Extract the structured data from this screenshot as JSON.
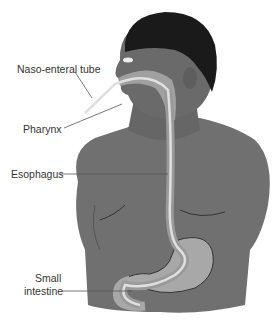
{
  "diagram": {
    "labels": {
      "tube": "Naso-enteral tube",
      "pharynx": "Pharynx",
      "esophagus": "Esophagus",
      "small_intestine_line1": "Small",
      "small_intestine_line2": "intestine"
    },
    "colors": {
      "skin": "#6e6e6e",
      "hair": "#1a1a1a",
      "organ": "#a8a8a8",
      "tube": "#d8d8d8",
      "leader": "#555555",
      "text": "#333333"
    }
  }
}
